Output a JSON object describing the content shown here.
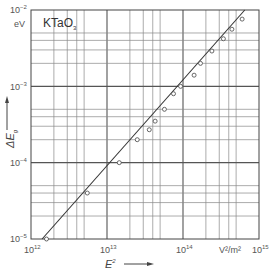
{
  "chart_data": {
    "type": "scatter",
    "title": "KTaO3",
    "xscale": "log",
    "yscale": "log",
    "xlabel": "E²",
    "xunit": "V²/m²",
    "ylabel": "ΔEg",
    "yunit": "eV",
    "xlim": [
      1000000000000.0,
      1000000000000000.0
    ],
    "ylim": [
      1e-05,
      0.01
    ],
    "x_ticks": [
      "10^12",
      "10^13",
      "10^14",
      "10^15"
    ],
    "y_ticks": [
      "10^-5",
      "10^-4",
      "10^-3",
      "10^-2"
    ],
    "grid": true,
    "legend": null,
    "series": [
      {
        "name": "measured",
        "marker": "open-circle",
        "x": [
          1600000000000.0,
          5500000000000.0,
          14500000000000.0,
          25000000000000.0,
          36000000000000.0,
          43000000000000.0,
          57000000000000.0,
          75000000000000.0,
          93000000000000.0,
          140000000000000.0,
          170000000000000.0,
          240000000000000.0,
          340000000000000.0,
          440000000000000.0,
          600000000000000.0
        ],
        "y": [
          1e-05,
          4e-05,
          0.0001,
          0.0002,
          0.00027,
          0.00035,
          0.0005,
          0.0008,
          0.001,
          0.0014,
          0.002,
          0.0029,
          0.0042,
          0.0056,
          0.0076
        ]
      },
      {
        "name": "fit",
        "style": "line",
        "x": [
          1400000000000.0,
          650000000000000.0
        ],
        "y": [
          1e-05,
          0.01
        ]
      }
    ]
  },
  "labels": {
    "title": "KTaO",
    "title_sub": "3",
    "y_unit": "eV",
    "y_axis_base": "ΔE",
    "y_axis_sub": "g",
    "x_axis_base": "E",
    "x_axis_sup": "2",
    "x_unit": "V²/m²",
    "x_tick_base": "10",
    "x_tick_exps": [
      "12",
      "13",
      "14",
      "15"
    ],
    "y_tick_base": "10",
    "y_tick_exps": [
      "−2",
      "−3",
      "−4",
      "−5"
    ]
  }
}
